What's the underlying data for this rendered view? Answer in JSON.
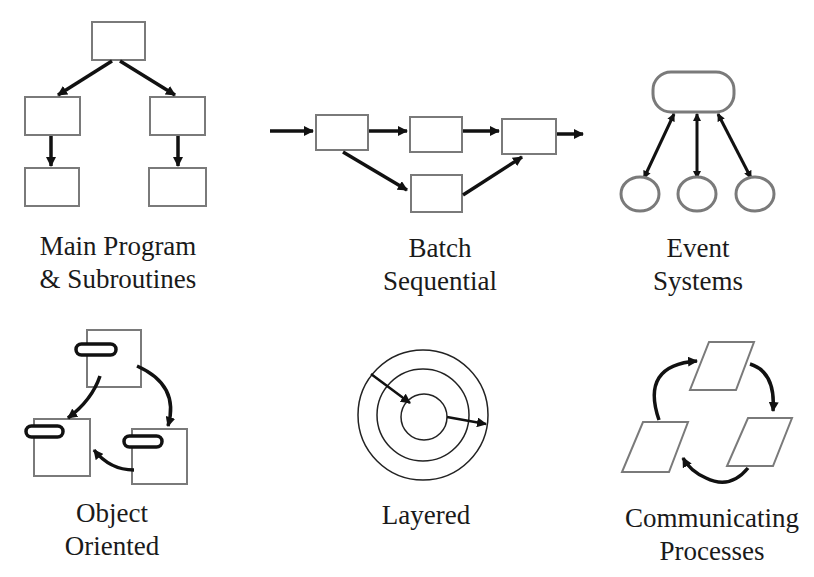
{
  "diagrams": [
    {
      "id": "main-program",
      "label_line1": "Main Program",
      "label_line2": "& Subroutines"
    },
    {
      "id": "batch-sequential",
      "label_line1": "Batch",
      "label_line2": "Sequential"
    },
    {
      "id": "event-systems",
      "label_line1": "Event",
      "label_line2": "Systems"
    },
    {
      "id": "object-oriented",
      "label_line1": "Object",
      "label_line2": "Oriented"
    },
    {
      "id": "layered",
      "label_line1": "Layered",
      "label_line2": ""
    },
    {
      "id": "communicating-processes",
      "label_line1": "Communicating",
      "label_line2": "Processes"
    }
  ],
  "colors": {
    "box_stroke": "#7a7a7a",
    "arrow": "#111111",
    "text": "#1a1a1a",
    "background": "#ffffff"
  }
}
